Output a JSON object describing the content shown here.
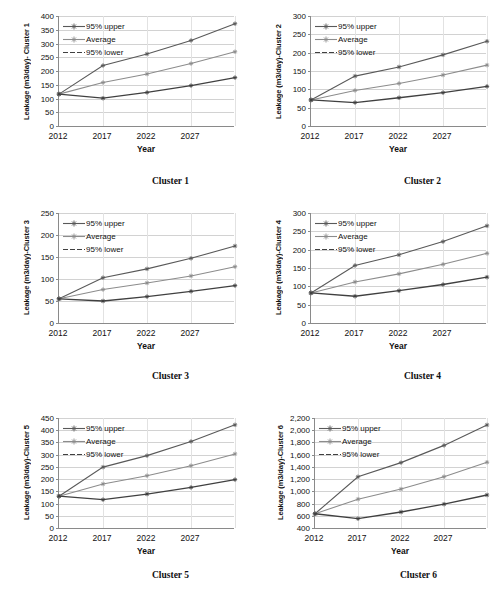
{
  "figure": {
    "series_names": [
      "95% upper",
      "Average",
      "95% lower"
    ],
    "x_label": "Year",
    "x_ticklabels": [
      "2012",
      "2017",
      "2022",
      "2027"
    ],
    "colors": {
      "upper": "#595959",
      "average": "#8c8c8c",
      "lower": "#404040",
      "gridline": "#d2d2d2",
      "axis": "#8a8a8a"
    }
  },
  "charts": [
    {
      "id": "cluster-1",
      "caption": "Cluster 1",
      "ylabel": "Leakage (m3/day)- Cluster 1",
      "yticks": [
        "0",
        "50",
        "100",
        "150",
        "200",
        "250",
        "300",
        "350",
        "400"
      ],
      "chart_data": {
        "type": "line",
        "title": "Cluster 1",
        "xlabel": "Year",
        "ylabel": "Leakage (m3/day)- Cluster 1",
        "x": [
          2012,
          2017,
          2022,
          2027,
          2032
        ],
        "xtick_values": [
          2012,
          2017,
          2022,
          2027
        ],
        "xlim": [
          2012,
          2032
        ],
        "ylim": [
          0,
          400
        ],
        "ytick_values": [
          0,
          50,
          100,
          150,
          200,
          250,
          300,
          350,
          400
        ],
        "grid": "horizontal",
        "legend": "upper-left",
        "series": [
          {
            "name": "95% upper",
            "values": [
              116,
              220,
              262,
              311,
              372
            ]
          },
          {
            "name": "Average",
            "values": [
              116,
              158,
              189,
              227,
              270
            ]
          },
          {
            "name": "95% lower",
            "values": [
              116,
              101,
              122,
              147,
              176
            ]
          }
        ]
      }
    },
    {
      "id": "cluster-2",
      "caption": "Cluster 2",
      "ylabel": "Leakage (m3/day)-Cluster 2",
      "yticks": [
        "0",
        "50",
        "100",
        "150",
        "200",
        "250",
        "300"
      ],
      "chart_data": {
        "type": "line",
        "title": "Cluster 2",
        "xlabel": "Year",
        "ylabel": "Leakage (m3/day)-Cluster 2",
        "x": [
          2012,
          2017,
          2022,
          2027,
          2032
        ],
        "xtick_values": [
          2012,
          2017,
          2022,
          2027
        ],
        "xlim": [
          2012,
          2032
        ],
        "ylim": [
          0,
          300
        ],
        "ytick_values": [
          0,
          50,
          100,
          150,
          200,
          250,
          300
        ],
        "grid": "horizontal",
        "legend": "upper-left",
        "series": [
          {
            "name": "95% upper",
            "values": [
              71,
              136,
              161,
              194,
              231
            ]
          },
          {
            "name": "Average",
            "values": [
              71,
              97,
              116,
              139,
              166
            ]
          },
          {
            "name": "95% lower",
            "values": [
              71,
              64,
              77,
              91,
              108
            ]
          }
        ]
      }
    },
    {
      "id": "cluster-3",
      "caption": "Cluster 3",
      "ylabel": "Leakage (m3/day)-Cluster 3",
      "yticks": [
        "0",
        "50",
        "100",
        "150",
        "200",
        "250"
      ],
      "chart_data": {
        "type": "line",
        "title": "Cluster 3",
        "xlabel": "Year",
        "ylabel": "Leakage (m3/day)-Cluster 3",
        "x": [
          2012,
          2017,
          2022,
          2027,
          2032
        ],
        "xtick_values": [
          2012,
          2017,
          2022,
          2027
        ],
        "xlim": [
          2012,
          2032
        ],
        "ylim": [
          0,
          250
        ],
        "ytick_values": [
          0,
          50,
          100,
          150,
          200,
          250
        ],
        "grid": "horizontal",
        "legend": "upper-left",
        "series": [
          {
            "name": "95% upper",
            "values": [
              55,
              103,
              123,
              147,
              175
            ]
          },
          {
            "name": "Average",
            "values": [
              55,
              76,
              91,
              107,
              128
            ]
          },
          {
            "name": "95% lower",
            "values": [
              55,
              50,
              60,
              72,
              85
            ]
          }
        ]
      }
    },
    {
      "id": "cluster-4",
      "caption": "Cluster 4",
      "ylabel": "Leakage (m3/day)-Cluster 4",
      "yticks": [
        "0",
        "50",
        "100",
        "150",
        "200",
        "250",
        "300"
      ],
      "chart_data": {
        "type": "line",
        "title": "Cluster 4",
        "xlabel": "Year",
        "ylabel": "Leakage (m3/day)-Cluster 4",
        "x": [
          2012,
          2017,
          2022,
          2027,
          2032
        ],
        "xtick_values": [
          2012,
          2017,
          2022,
          2027
        ],
        "xlim": [
          2012,
          2032
        ],
        "ylim": [
          0,
          300
        ],
        "ytick_values": [
          0,
          50,
          100,
          150,
          200,
          250,
          300
        ],
        "grid": "horizontal",
        "legend": "upper-left",
        "series": [
          {
            "name": "95% upper",
            "values": [
              82,
              157,
              186,
              222,
              265
            ]
          },
          {
            "name": "Average",
            "values": [
              82,
              112,
              134,
              160,
              190
            ]
          },
          {
            "name": "95% lower",
            "values": [
              82,
              73,
              88,
              105,
              125
            ]
          }
        ]
      }
    },
    {
      "id": "cluster-5",
      "caption": "Cluster 5",
      "ylabel": "Leakage (m3/day)-Cluster 5",
      "yticks": [
        "0",
        "50",
        "100",
        "150",
        "200",
        "250",
        "300",
        "350",
        "400",
        "450"
      ],
      "chart_data": {
        "type": "line",
        "title": "Cluster 5",
        "xlabel": "Year",
        "ylabel": "Leakage (m3/day)-Cluster 5",
        "x": [
          2012,
          2017,
          2022,
          2027,
          2032
        ],
        "xtick_values": [
          2012,
          2017,
          2022,
          2027
        ],
        "xlim": [
          2012,
          2032
        ],
        "ylim": [
          0,
          450
        ],
        "ytick_values": [
          0,
          50,
          100,
          150,
          200,
          250,
          300,
          350,
          400,
          450
        ],
        "grid": "horizontal",
        "legend": "upper-left",
        "series": [
          {
            "name": "95% upper",
            "values": [
              130,
              249,
              296,
              354,
              422
            ]
          },
          {
            "name": "Average",
            "values": [
              130,
              180,
              214,
              255,
              303
            ]
          },
          {
            "name": "95% lower",
            "values": [
              130,
              116,
              139,
              166,
              198
            ]
          }
        ]
      }
    },
    {
      "id": "cluster-6",
      "caption": "Cluster 6",
      "ylabel": "Leakage (m3/day)-Cluster 6",
      "yticks": [
        "400",
        "600",
        "800",
        "1,000",
        "1,200",
        "1,400",
        "1,600",
        "1,800",
        "2,000",
        "2,200"
      ],
      "chart_data": {
        "type": "line",
        "title": "Cluster 6",
        "xlabel": "Year",
        "ylabel": "Leakage (m3/day)-Cluster 6",
        "x": [
          2012,
          2017,
          2022,
          2027,
          2032
        ],
        "xtick_values": [
          2012,
          2017,
          2022,
          2027
        ],
        "xlim": [
          2012,
          2032
        ],
        "ylim": [
          400,
          2200
        ],
        "ytick_values": [
          400,
          600,
          800,
          1000,
          1200,
          1400,
          1600,
          1800,
          2000,
          2200
        ],
        "grid": "horizontal",
        "legend": "upper-left",
        "series": [
          {
            "name": "95% upper",
            "values": [
              633,
              1238,
              1470,
              1752,
              2086
            ]
          },
          {
            "name": "Average",
            "values": [
              633,
              872,
              1037,
              1240,
              1476
            ]
          },
          {
            "name": "95% lower",
            "values": [
              633,
              553,
              662,
              790,
              940
            ]
          }
        ]
      }
    }
  ]
}
